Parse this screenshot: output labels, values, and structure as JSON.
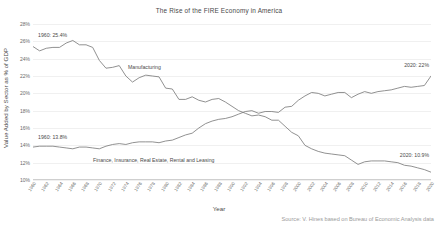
{
  "chart_data": {
    "type": "line",
    "title": "The Rise of the FIRE Economy in America",
    "xlabel": "Year",
    "ylabel": "Value Added by Sector as % of GDP",
    "source": "Source: V. Hines based on Bureau of Economic Analysis data",
    "grid": true,
    "legend": "inline-labels",
    "xlim": [
      1960,
      2020
    ],
    "ylim": [
      10,
      28
    ],
    "yticks": [
      "10%",
      "12%",
      "14%",
      "16%",
      "18%",
      "20%",
      "22%",
      "24%",
      "26%",
      "28%"
    ],
    "ytick_values": [
      10,
      12,
      14,
      16,
      18,
      20,
      22,
      24,
      26,
      28
    ],
    "xticks": [
      "1960",
      "1962",
      "1964",
      "1966",
      "1968",
      "1970",
      "1972",
      "1974",
      "1976",
      "1978",
      "1980",
      "1982",
      "1984",
      "1986",
      "1988",
      "1990",
      "1992",
      "1994",
      "1996",
      "1998",
      "2000",
      "2002",
      "2004",
      "2006",
      "2008",
      "2010",
      "2012",
      "2014",
      "2016",
      "2018",
      "2020"
    ],
    "x": [
      1960,
      1961,
      1962,
      1963,
      1964,
      1965,
      1966,
      1967,
      1968,
      1969,
      1970,
      1971,
      1972,
      1973,
      1974,
      1975,
      1976,
      1977,
      1978,
      1979,
      1980,
      1981,
      1982,
      1983,
      1984,
      1985,
      1986,
      1987,
      1988,
      1989,
      1990,
      1991,
      1992,
      1993,
      1994,
      1995,
      1996,
      1997,
      1998,
      1999,
      2000,
      2001,
      2002,
      2003,
      2004,
      2005,
      2006,
      2007,
      2008,
      2009,
      2010,
      2011,
      2012,
      2013,
      2014,
      2015,
      2016,
      2017,
      2018,
      2019,
      2020
    ],
    "series": [
      {
        "name": "Manufacturing",
        "color": "#7d7d7d",
        "values": [
          25.4,
          24.9,
          25.2,
          25.3,
          25.3,
          25.8,
          26.1,
          25.6,
          25.6,
          25.3,
          23.8,
          22.9,
          23.0,
          23.2,
          22.0,
          21.3,
          21.8,
          22.1,
          22.0,
          21.9,
          20.6,
          20.5,
          19.3,
          19.3,
          19.6,
          19.2,
          19.0,
          19.3,
          19.4,
          19.0,
          18.5,
          18.0,
          17.7,
          17.4,
          17.5,
          17.3,
          16.9,
          16.9,
          16.2,
          15.5,
          15.1,
          14.0,
          13.6,
          13.3,
          13.1,
          13.0,
          12.9,
          12.8,
          12.3,
          11.8,
          12.1,
          12.2,
          12.2,
          12.2,
          12.1,
          12.0,
          11.7,
          11.6,
          11.4,
          11.2,
          10.9
        ],
        "start_label": "1960: 25.4%",
        "end_label": "2020: 10.9%"
      },
      {
        "name": "Finance, Insurance, Real Estate, Rental and Leasing",
        "color": "#7d7d7d",
        "values": [
          13.8,
          13.9,
          13.9,
          13.9,
          13.8,
          13.7,
          13.6,
          13.8,
          13.8,
          13.7,
          13.6,
          13.9,
          14.1,
          14.2,
          14.1,
          14.3,
          14.4,
          14.4,
          14.4,
          14.3,
          14.5,
          14.6,
          14.9,
          15.2,
          15.4,
          16.0,
          16.5,
          16.8,
          17.0,
          17.1,
          17.3,
          17.6,
          17.9,
          18.0,
          17.7,
          17.9,
          17.9,
          17.8,
          18.4,
          18.5,
          19.2,
          19.7,
          20.1,
          20.0,
          19.7,
          19.9,
          20.1,
          20.1,
          19.5,
          19.9,
          20.2,
          20.0,
          20.2,
          20.3,
          20.4,
          20.6,
          20.8,
          20.7,
          20.8,
          20.9,
          22.0
        ],
        "start_label": "1960: 13.8%",
        "end_label": "2020: 22%"
      }
    ],
    "annotations": [
      {
        "text": "1960: 25.4%",
        "name": "annotation-manufacturing-start"
      },
      {
        "text": "1960: 13.8%",
        "name": "annotation-fire-start"
      },
      {
        "text": "2020: 22%",
        "name": "annotation-fire-end"
      },
      {
        "text": "2020: 10.9%",
        "name": "annotation-manufacturing-end"
      },
      {
        "text": "Manufacturing",
        "name": "series-label-manufacturing"
      },
      {
        "text": "Finance, Insurance, Real Estate, Rental and Leasing",
        "name": "series-label-fire"
      }
    ]
  }
}
